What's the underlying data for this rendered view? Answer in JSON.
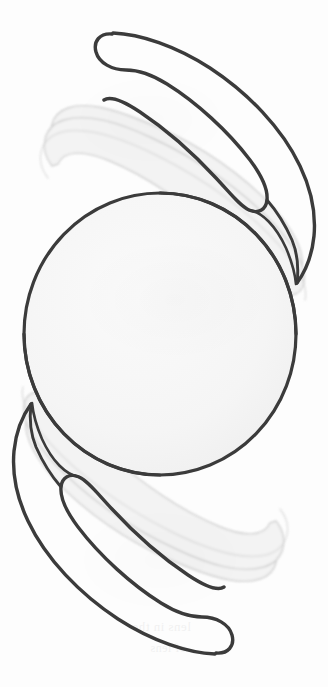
{
  "figure": {
    "view": "en face (front) view",
    "background_color": "#fdfdfd",
    "ink_color": "#3a3a3a",
    "ghost_color": "#cfcfcf",
    "optic_fill": "#f6f6f6",
    "canvas": {
      "width": 328,
      "height": 687
    }
  },
  "parts": [
    {
      "id": "optic",
      "label": "Optic",
      "interactable": false
    },
    {
      "id": "haptic-upper",
      "label": "Upper haptic",
      "interactable": false
    },
    {
      "id": "haptic-lower",
      "label": "Lower haptic",
      "interactable": false
    },
    {
      "id": "ghost-upper",
      "label": "Upper haptic ghost outline",
      "interactable": false
    },
    {
      "id": "ghost-lower",
      "label": "Lower haptic ghost outline",
      "interactable": false
    }
  ],
  "geometry": {
    "optic": {
      "cx": 160,
      "cy": 334,
      "rx": 136,
      "ry": 141
    },
    "haptic_upper_tip": {
      "x": 108,
      "y": 45
    },
    "haptic_lower_tip": {
      "x": 212,
      "y": 607
    },
    "stroke_width_main": 3.4,
    "stroke_width_ghost": 1.5
  },
  "bleed_through_text": [
    {
      "text": "of the optic and",
      "x": 118,
      "y": 258,
      "size": 13
    },
    {
      "text": "the haptics. That the",
      "x": 104,
      "y": 283,
      "size": 13
    },
    {
      "text": "complete and the",
      "x": 112,
      "y": 308,
      "size": 13
    },
    {
      "text": "should be seen in",
      "x": 108,
      "y": 333,
      "size": 13
    },
    {
      "text": "the lens can be",
      "x": 120,
      "y": 358,
      "size": 13
    },
    {
      "text": "been noted",
      "x": 130,
      "y": 383,
      "size": 12
    },
    {
      "text": "lens in the",
      "x": 132,
      "y": 619,
      "size": 13
    },
    {
      "text": "of lens",
      "x": 150,
      "y": 641,
      "size": 12
    }
  ]
}
